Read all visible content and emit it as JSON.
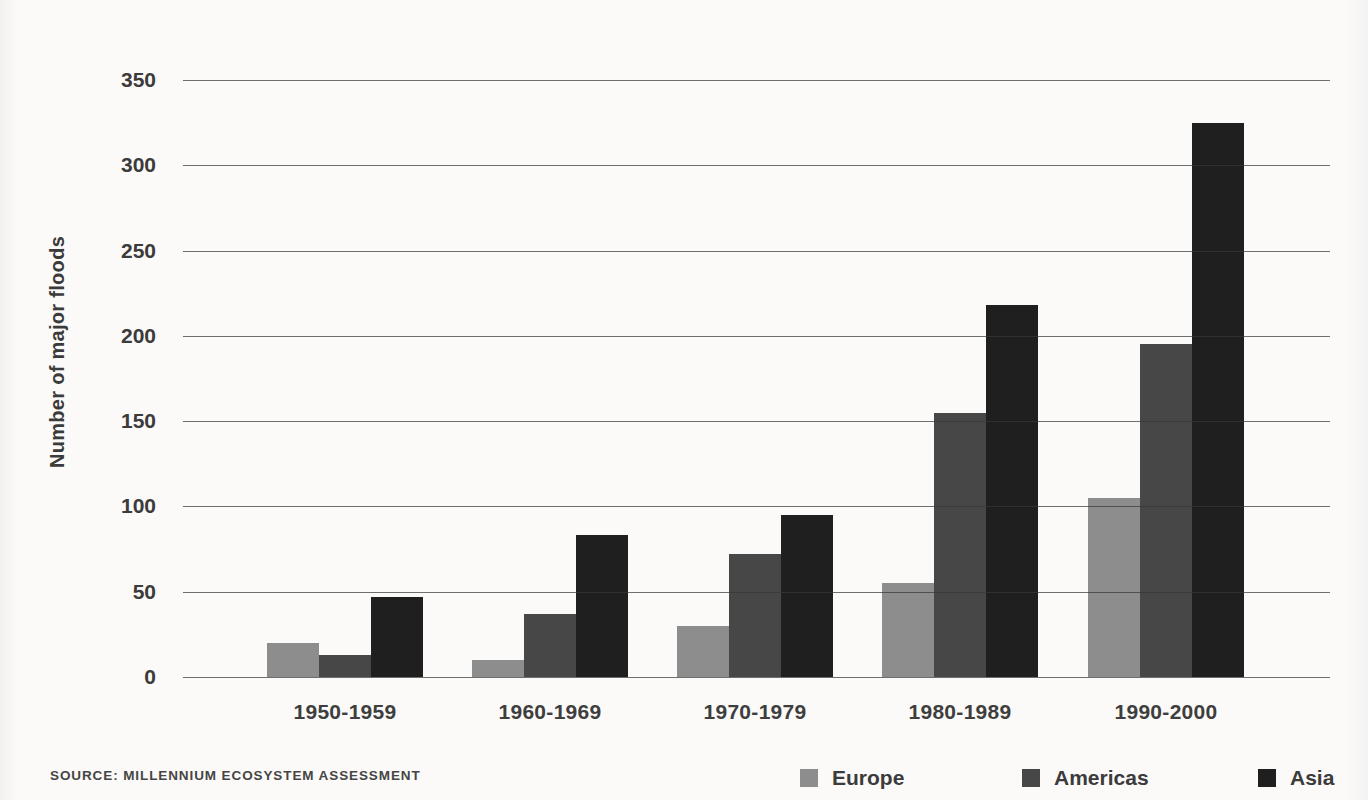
{
  "chart_data": {
    "type": "bar",
    "title": "",
    "ylabel": "Number of major floods",
    "xlabel": "",
    "categories": [
      "1950-1959",
      "1960-1969",
      "1970-1979",
      "1980-1989",
      "1990-2000"
    ],
    "series": [
      {
        "name": "Europe",
        "color": "#8d8d8d",
        "values": [
          20,
          10,
          30,
          55,
          105
        ]
      },
      {
        "name": "Americas",
        "color": "#474747",
        "values": [
          13,
          37,
          72,
          155,
          195
        ]
      },
      {
        "name": "Asia",
        "color": "#1f1f1f",
        "values": [
          47,
          83,
          95,
          218,
          325
        ]
      }
    ],
    "ylim": [
      0,
      350
    ],
    "yticks": [
      0,
      50,
      100,
      150,
      200,
      250,
      300,
      350
    ],
    "grid": true,
    "gridline_color": "#4d4d4d",
    "legend_position": "bottom-right"
  },
  "source_note": "SOURCE: MILLENNIUM ECOSYSTEM ASSESSMENT",
  "colors": {
    "background": "#fbfaf8",
    "text": "#3b3b3b"
  }
}
